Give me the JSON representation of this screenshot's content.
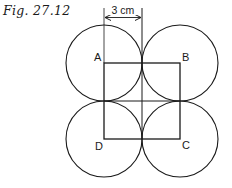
{
  "caption": "Fig. 27.12",
  "dimension": {
    "label": "3 cm"
  },
  "points": {
    "A": "A",
    "B": "B",
    "C": "C",
    "D": "D"
  },
  "geometry": {
    "radius": 38,
    "centers": {
      "A": [
        104,
        63
      ],
      "B": [
        180,
        63
      ],
      "C": [
        180,
        139
      ],
      "D": [
        104,
        139
      ]
    }
  },
  "colors": {
    "stroke": "#1a1a1a",
    "background": "#ffffff"
  }
}
